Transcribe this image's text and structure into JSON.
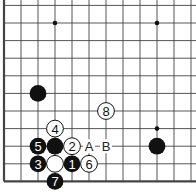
{
  "diagram": {
    "type": "go-board-fragment",
    "grid": {
      "origin_x": 4,
      "origin_y": 23,
      "dx": 17,
      "dy": 17.6,
      "cols": 12,
      "rows": 10
    },
    "edges": {
      "left": true,
      "bottom": true,
      "top": false,
      "right": false
    },
    "star_points": [
      {
        "col": 3,
        "row": 0
      },
      {
        "col": 9,
        "row": 0
      },
      {
        "col": 9,
        "row": 6
      }
    ],
    "stones": [
      {
        "col": 2,
        "row": 4,
        "color": "black",
        "label": ""
      },
      {
        "col": 9,
        "row": 7,
        "color": "black",
        "label": ""
      },
      {
        "col": 3,
        "row": 7,
        "color": "black",
        "label": ""
      },
      {
        "col": 3,
        "row": 8,
        "color": "white",
        "label": ""
      },
      {
        "col": 4,
        "row": 8,
        "color": "black",
        "label": "1"
      },
      {
        "col": 4,
        "row": 7,
        "color": "white",
        "label": "2"
      },
      {
        "col": 2,
        "row": 8,
        "color": "black",
        "label": "3"
      },
      {
        "col": 3,
        "row": 6,
        "color": "white",
        "label": "4"
      },
      {
        "col": 2,
        "row": 7,
        "color": "black",
        "label": "5"
      },
      {
        "col": 5,
        "row": 8,
        "color": "white",
        "label": "6"
      },
      {
        "col": 3,
        "row": 9,
        "color": "black",
        "label": "7"
      },
      {
        "col": 6,
        "row": 5,
        "color": "white",
        "label": "8"
      }
    ],
    "marks": [
      {
        "col": 5,
        "row": 7,
        "label": "A"
      },
      {
        "col": 6,
        "row": 7,
        "label": "B"
      }
    ],
    "colors": {
      "line": "#444444",
      "black": "#111111",
      "white": "#ffffff",
      "edge": "#000000"
    }
  }
}
